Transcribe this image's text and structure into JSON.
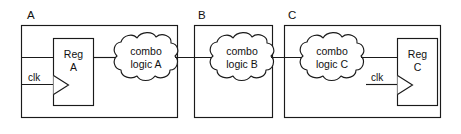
{
  "diagram": {
    "type": "digital-logic-block-diagram",
    "colors": {
      "stroke": "#1a1a1a",
      "background": "#ffffff",
      "text": "#111111"
    },
    "partitions": [
      {
        "id": "A",
        "label": "A"
      },
      {
        "id": "B",
        "label": "B"
      },
      {
        "id": "C",
        "label": "C"
      }
    ],
    "registers": [
      {
        "id": "reg-a",
        "line1": "Reg",
        "line2": "A",
        "clock_label": "clk",
        "partition": "A"
      },
      {
        "id": "reg-c",
        "line1": "Reg",
        "line2": "C",
        "clock_label": "clk",
        "partition": "C"
      }
    ],
    "clouds": [
      {
        "id": "combo-a",
        "line1": "combo",
        "line2": "logic A",
        "partition": "A"
      },
      {
        "id": "combo-b",
        "line1": "combo",
        "line2": "logic B",
        "partition": "B"
      },
      {
        "id": "combo-c",
        "line1": "combo",
        "line2": "logic C",
        "partition": "C"
      }
    ],
    "wires": [
      {
        "id": "wire-input-to-reg-a",
        "from": "partition-A-left-edge",
        "to": "reg-a-data-input"
      },
      {
        "id": "wire-clk-to-reg-a",
        "from": "partition-A-left-edge",
        "to": "reg-a-clock-input"
      },
      {
        "id": "wire-reg-a-to-combo-a",
        "from": "reg-a-output",
        "to": "combo-a-input"
      },
      {
        "id": "wire-combo-a-to-combo-b",
        "from": "combo-a-output",
        "to": "combo-b-input"
      },
      {
        "id": "wire-combo-b-to-combo-c",
        "from": "combo-b-output",
        "to": "combo-c-input"
      },
      {
        "id": "wire-combo-c-to-reg-c",
        "from": "combo-c-output",
        "to": "reg-c-data-input"
      },
      {
        "id": "wire-clk-to-reg-c",
        "from": "partition-C-interior",
        "to": "reg-c-clock-input"
      }
    ]
  }
}
